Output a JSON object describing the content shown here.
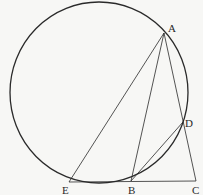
{
  "figure": {
    "type": "geometry",
    "colors": {
      "stroke": "#2a2a2a",
      "background": "#f7f7f5"
    },
    "circle": {
      "cx": 99,
      "cy": 92.5,
      "rx": 89,
      "ry": 90.5
    },
    "points": {
      "A": {
        "label": "A",
        "x": 164,
        "y": 33
      },
      "B": {
        "label": "B",
        "x": 131,
        "y": 181
      },
      "C": {
        "label": "C",
        "x": 196,
        "y": 181
      },
      "D": {
        "label": "D",
        "x": 183,
        "y": 122
      },
      "E": {
        "label": "E",
        "x": 69,
        "y": 182
      }
    },
    "segments": [
      [
        "A",
        "E"
      ],
      [
        "A",
        "B"
      ],
      [
        "A",
        "C"
      ],
      [
        "B",
        "D"
      ],
      [
        "E",
        "C"
      ]
    ]
  }
}
